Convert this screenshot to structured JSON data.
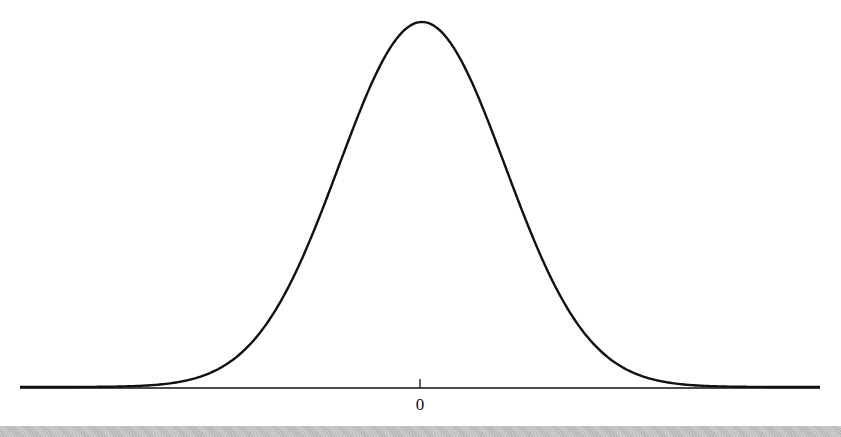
{
  "chart_data": {
    "type": "line",
    "title": "",
    "subtitle": "",
    "xlabel": "",
    "ylabel": "",
    "series": [
      {
        "name": "normal density",
        "distribution": "normal",
        "mean": 0,
        "x": [
          -4.0,
          -3.0,
          -2.5,
          -2.0,
          -1.5,
          -1.0,
          -0.5,
          0.0,
          0.5,
          1.0,
          1.5,
          2.0,
          2.5,
          3.0,
          4.0
        ],
        "y": [
          0.0001,
          0.0044,
          0.0175,
          0.054,
          0.1295,
          0.242,
          0.3521,
          0.3989,
          0.3521,
          0.242,
          0.1295,
          0.054,
          0.0175,
          0.0044,
          0.0001
        ]
      }
    ],
    "x_ticks": [
      {
        "value": 0,
        "label": "0"
      }
    ],
    "y_ticks": [],
    "grid": false,
    "legend": null,
    "color": "#111111"
  },
  "axis": {
    "tick_label": "0"
  }
}
